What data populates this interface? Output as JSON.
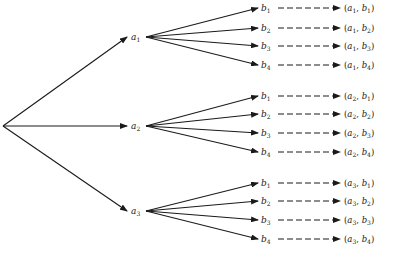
{
  "diagram": {
    "type": "tree",
    "root": {
      "x": 3,
      "y": 126
    },
    "level1": [
      {
        "label": "a",
        "sub": "1",
        "x": 135,
        "y": 37
      },
      {
        "label": "a",
        "sub": "2",
        "x": 135,
        "y": 126
      },
      {
        "label": "a",
        "sub": "3",
        "x": 135,
        "y": 211
      }
    ],
    "level2_labels": [
      {
        "label": "b",
        "sub": "1"
      },
      {
        "label": "b",
        "sub": "2"
      },
      {
        "label": "b",
        "sub": "3"
      },
      {
        "label": "b",
        "sub": "4"
      }
    ],
    "groups": [
      {
        "parent": 0,
        "rows_y": [
          8,
          28,
          46,
          65
        ]
      },
      {
        "parent": 1,
        "rows_y": [
          96,
          114,
          133,
          152
        ]
      },
      {
        "parent": 2,
        "rows_y": [
          183,
          201,
          220,
          239
        ]
      }
    ],
    "pairs": [
      [
        "(a1, b1)",
        "(a1, b2)",
        "(a1, b3)",
        "(a1, b4)"
      ],
      [
        "(a2, b1)",
        "(a2, b2)",
        "(a2, b3)",
        "(a2, b4)"
      ],
      [
        "(a3, b1)",
        "(a3, b2)",
        "(a3, b3)",
        "(a3, b4)"
      ]
    ],
    "colors": {
      "ink": "#1a1a1a",
      "background": "#ffffff"
    }
  }
}
